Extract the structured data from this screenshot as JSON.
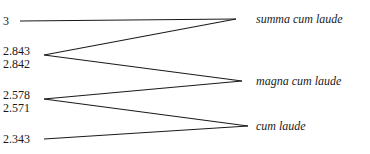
{
  "diagram": {
    "type": "threshold-mapping",
    "values": [
      {
        "label": "3"
      },
      {
        "label": "2.843"
      },
      {
        "label": "2.842"
      },
      {
        "label": "2.578"
      },
      {
        "label": "2.571"
      },
      {
        "label": "2.343"
      }
    ],
    "categories": [
      {
        "label": "summa cum laude"
      },
      {
        "label": "magna cum laude"
      },
      {
        "label": "cum laude"
      }
    ],
    "ranges": [
      {
        "category": "summa cum laude",
        "from": "2.843",
        "to": "3"
      },
      {
        "category": "magna cum laude",
        "from": "2.578",
        "to": "2.842"
      },
      {
        "category": "cum laude",
        "from": "2.343",
        "to": "2.571"
      }
    ],
    "line_color": "#1a1a1a"
  }
}
